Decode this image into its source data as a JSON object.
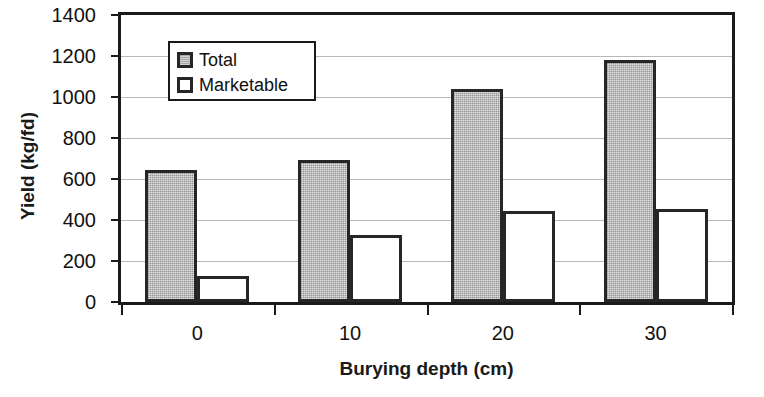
{
  "chart_data": {
    "type": "bar",
    "title": "",
    "xlabel": "Burying depth (cm)",
    "ylabel": "Yield (kg/fd)",
    "categories": [
      "0",
      "10",
      "20",
      "30"
    ],
    "series": [
      {
        "name": "Total",
        "values": [
          645,
          695,
          1040,
          1180
        ],
        "color": "#a9a9a9"
      },
      {
        "name": "Marketable",
        "values": [
          125,
          325,
          443,
          452
        ],
        "color": "#ffffff"
      }
    ],
    "ylim": [
      0,
      1400
    ],
    "ytick_labels": [
      "0",
      "200",
      "400",
      "600",
      "800",
      "1000",
      "1200",
      "1400"
    ],
    "ytick_values": [
      0,
      200,
      400,
      600,
      800,
      1000,
      1200,
      1400
    ],
    "grid": true,
    "legend_position": "upper-left-inside"
  },
  "legend": {
    "entries": [
      {
        "label": "Total"
      },
      {
        "label": "Marketable"
      }
    ]
  }
}
